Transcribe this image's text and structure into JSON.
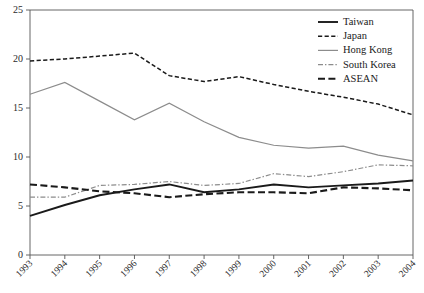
{
  "chart_data": {
    "type": "line",
    "title": "",
    "subtitle": "",
    "xlabel": "",
    "ylabel": "",
    "categories": [
      "1993",
      "1994",
      "1995",
      "1996",
      "1997",
      "1998",
      "1999",
      "2000",
      "2001",
      "2002",
      "2003",
      "2004"
    ],
    "x": [
      1993,
      1994,
      1995,
      1996,
      1997,
      1998,
      1999,
      2000,
      2001,
      2002,
      2003,
      2004
    ],
    "ylim": [
      0,
      25
    ],
    "xlim": [
      1993,
      2004
    ],
    "yticks": [
      0,
      5,
      10,
      15,
      20,
      25
    ],
    "ytick_labels": [
      "0",
      "5",
      "10",
      "15",
      "20",
      "25"
    ],
    "xtick_labels": [
      "1993",
      "1994",
      "1995",
      "1996",
      "1997",
      "1998",
      "1999",
      "2000",
      "2001",
      "2002",
      "2003",
      "2004"
    ],
    "grid": false,
    "legend_position": "top-right",
    "series": [
      {
        "name": "Taiwan",
        "style": "solid",
        "color": "#1a1a1a",
        "width": 1.9,
        "values": [
          4.0,
          5.1,
          6.1,
          6.7,
          7.2,
          6.4,
          6.7,
          7.2,
          6.9,
          7.1,
          7.3,
          7.6
        ]
      },
      {
        "name": "Japan",
        "style": "dashed",
        "color": "#1a1a1a",
        "width": 1.5,
        "values": [
          19.8,
          20.0,
          20.3,
          20.6,
          18.3,
          17.7,
          18.2,
          17.4,
          16.7,
          16.1,
          15.4,
          14.3
        ]
      },
      {
        "name": "Hong Kong",
        "style": "solid",
        "color": "#8c8c8c",
        "width": 1.2,
        "values": [
          16.4,
          17.6,
          15.7,
          13.8,
          15.5,
          13.6,
          12.0,
          11.2,
          10.9,
          11.1,
          10.2,
          9.6
        ]
      },
      {
        "name": "South Korea",
        "style": "dashdot",
        "color": "#8c8c8c",
        "width": 1.2,
        "values": [
          5.9,
          5.9,
          7.1,
          7.2,
          7.5,
          7.1,
          7.3,
          8.3,
          8.0,
          8.5,
          9.2,
          9.1
        ]
      },
      {
        "name": "ASEAN",
        "style": "dashed-thick",
        "color": "#1a1a1a",
        "width": 2.1,
        "values": [
          7.2,
          6.9,
          6.5,
          6.3,
          5.9,
          6.2,
          6.4,
          6.4,
          6.3,
          6.9,
          6.8,
          6.6
        ]
      }
    ]
  },
  "legend": {
    "entries": [
      {
        "label": "Taiwan"
      },
      {
        "label": "Japan"
      },
      {
        "label": "Hong Kong"
      },
      {
        "label": "South Korea"
      },
      {
        "label": "ASEAN"
      }
    ]
  },
  "colors": {
    "axis": "#555555",
    "text": "#1a1a1a",
    "dark_series": "#1a1a1a",
    "gray_series": "#8c8c8c",
    "background": "#ffffff"
  }
}
